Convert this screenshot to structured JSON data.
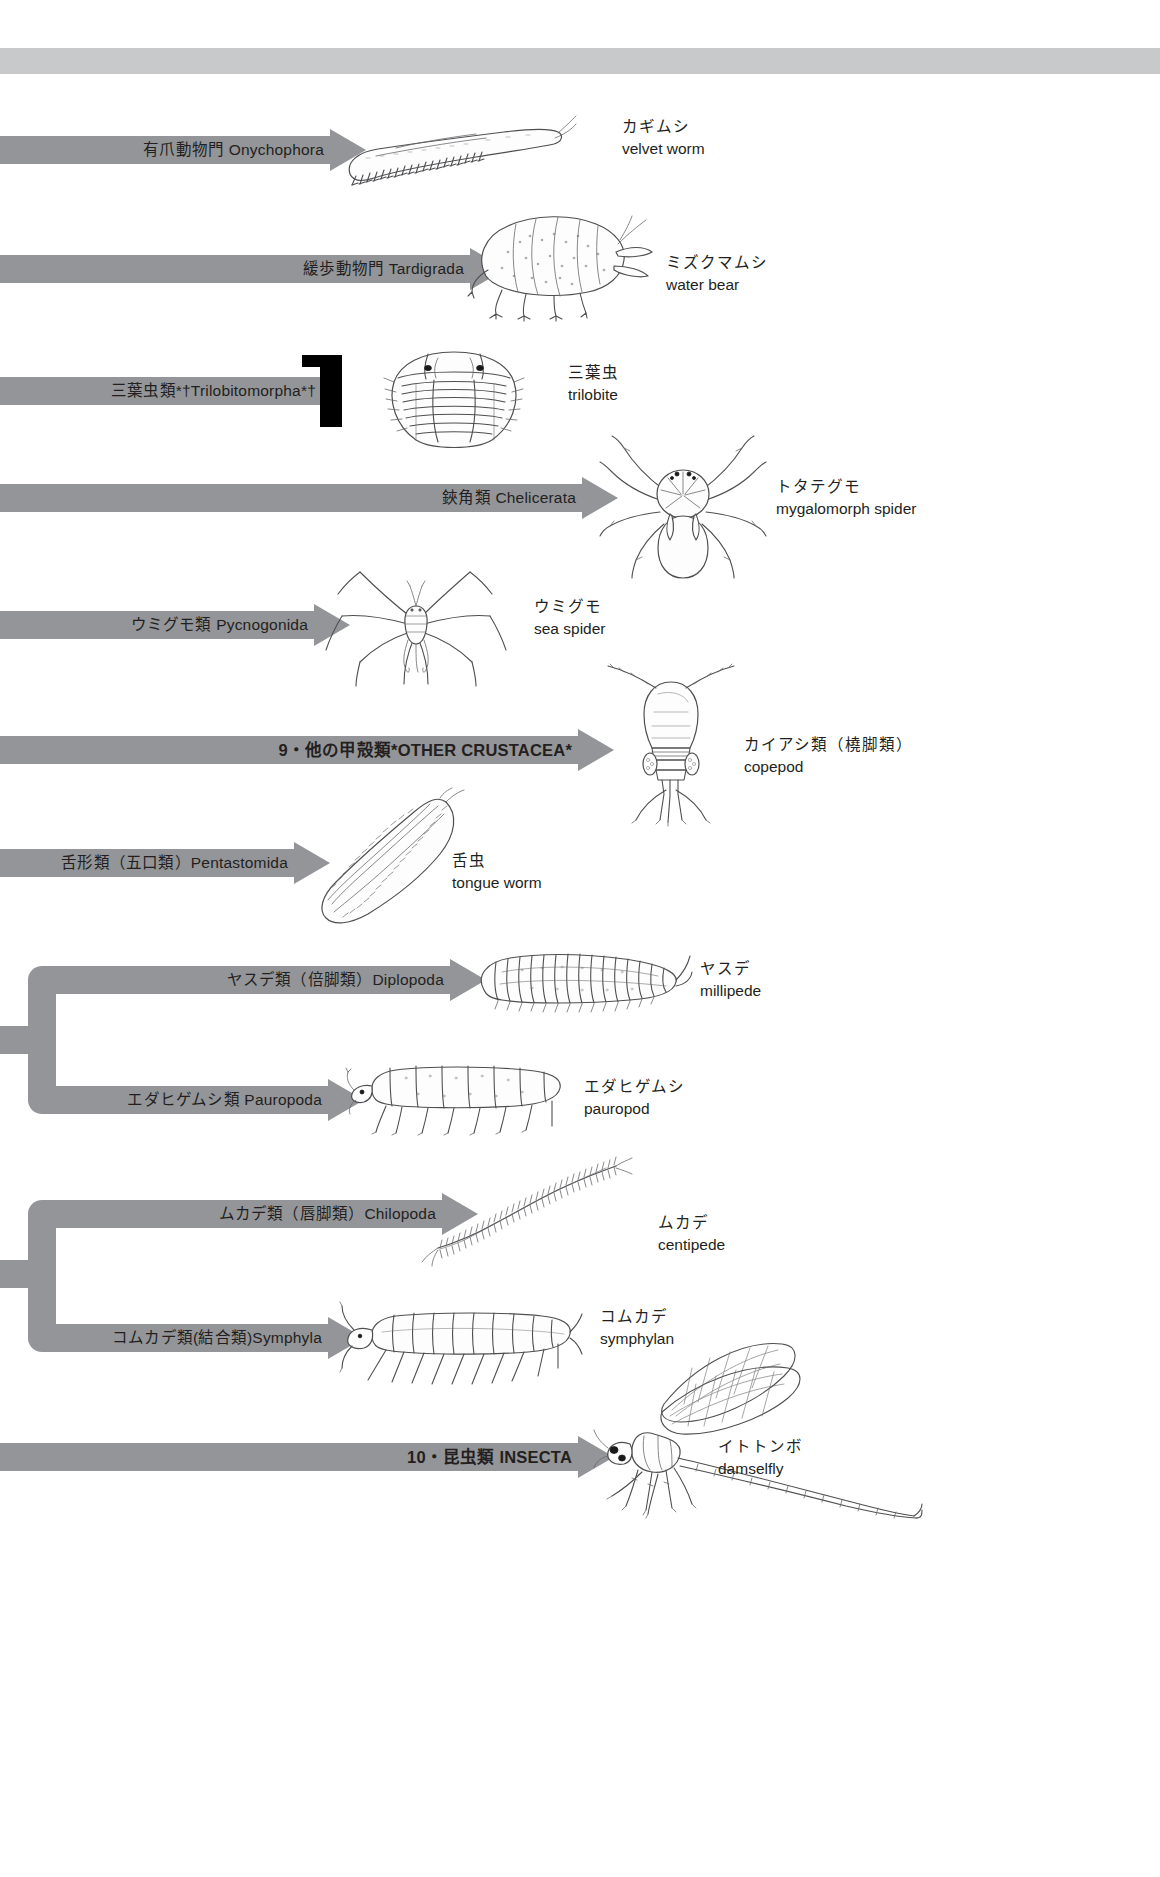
{
  "figure": {
    "type": "phylogenetic-cladogram",
    "title_banner": "",
    "accent_bar_color": "#939598",
    "banner_color": "#c7c9cb",
    "extinct_marker_color": "#000000"
  },
  "taxa": [
    {
      "id": "onychophora",
      "bar_label": "有爪動物門 Onychophora",
      "caption_jp": "カギムシ",
      "caption_en": "velvet worm",
      "illustration": "velvet-worm",
      "extinct": false,
      "bold": false
    },
    {
      "id": "tardigrada",
      "bar_label": "緩歩動物門 Tardigrada",
      "caption_jp": "ミズクマムシ",
      "caption_en": "water bear",
      "illustration": "water-bear",
      "extinct": false,
      "bold": false
    },
    {
      "id": "trilobitomorpha",
      "bar_label": "三葉虫類*†Trilobitomorpha*†",
      "caption_jp": "三葉虫",
      "caption_en": "trilobite",
      "illustration": "trilobite",
      "extinct": true,
      "bold": false
    },
    {
      "id": "chelicerata",
      "bar_label": "鋏角類 Chelicerata",
      "caption_jp": "トタテグモ",
      "caption_en": "mygalomorph spider",
      "illustration": "mygalomorph-spider",
      "extinct": false,
      "bold": false
    },
    {
      "id": "pycnogonida",
      "bar_label": "ウミグモ類 Pycnogonida",
      "caption_jp": "ウミグモ",
      "caption_en": "sea spider",
      "illustration": "sea-spider",
      "extinct": false,
      "bold": false
    },
    {
      "id": "other-crustacea",
      "bar_label": "9・他の甲殻類*OTHER CRUSTACEA*",
      "caption_jp": "カイアシ類（橈脚類）",
      "caption_en": "copepod",
      "illustration": "copepod",
      "extinct": false,
      "bold": true
    },
    {
      "id": "pentastomida",
      "bar_label": "舌形類（五口類）Pentastomida",
      "caption_jp": "舌虫",
      "caption_en": "tongue worm",
      "illustration": "tongue-worm",
      "extinct": false,
      "bold": false
    },
    {
      "id": "diplopoda",
      "bar_label": "ヤスデ類（倍脚類）Diplopoda",
      "caption_jp": "ヤスデ",
      "caption_en": "millipede",
      "illustration": "millipede",
      "extinct": false,
      "bold": false
    },
    {
      "id": "pauropoda",
      "bar_label": "エダヒゲムシ類 Pauropoda",
      "caption_jp": "エダヒゲムシ",
      "caption_en": "pauropod",
      "illustration": "pauropod",
      "extinct": false,
      "bold": false
    },
    {
      "id": "chilopoda",
      "bar_label": "ムカデ類（唇脚類）Chilopoda",
      "caption_jp": "ムカデ",
      "caption_en": "centipede",
      "illustration": "centipede",
      "extinct": false,
      "bold": false
    },
    {
      "id": "symphyla",
      "bar_label": "コムカデ類(結合類)Symphyla",
      "caption_jp": "コムカデ",
      "caption_en": "symphylan",
      "illustration": "symphylan",
      "extinct": false,
      "bold": false
    },
    {
      "id": "insecta",
      "bar_label": "10・昆虫類 INSECTA",
      "caption_jp": "イトトンボ",
      "caption_en": "damselfly",
      "illustration": "damselfly",
      "extinct": false,
      "bold": true
    }
  ],
  "clades": [
    {
      "id": "progoneata-clade",
      "members": [
        "diplopoda",
        "pauropoda"
      ]
    },
    {
      "id": "chilopoda-symphyla-clade",
      "members": [
        "chilopoda",
        "symphyla"
      ]
    }
  ]
}
